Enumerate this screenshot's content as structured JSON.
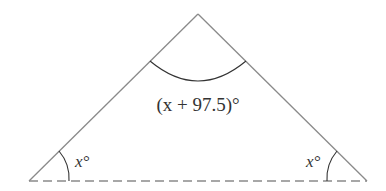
{
  "diagram": {
    "type": "triangle",
    "colors": {
      "stroke": "#8a8a8a",
      "arc": "#333333",
      "text": "#333333"
    },
    "labels": {
      "apex_angle": "(x + 97.5)°",
      "left_angle": "x°",
      "right_angle": "x°"
    },
    "base_style": "dashed"
  }
}
